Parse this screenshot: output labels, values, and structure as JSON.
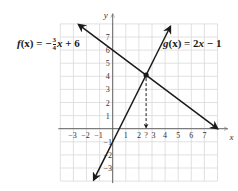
{
  "chart_data": {
    "type": "line",
    "title": "",
    "xlabel": "x",
    "ylabel": "y",
    "xlim": [
      -4,
      8
    ],
    "ylim": [
      -4,
      8
    ],
    "grid": true,
    "x_ticks": [
      -3,
      -2,
      -1,
      1,
      2,
      3,
      4,
      5,
      6,
      7
    ],
    "y_ticks": [
      -3,
      -2,
      -1,
      1,
      2,
      3,
      4,
      5,
      6,
      7
    ],
    "x_tick_labels": [
      "-3",
      "-2",
      "-1",
      "1",
      "2",
      "?",
      "3",
      "4",
      "5",
      "6",
      "7"
    ],
    "series": [
      {
        "name": "f(x) = -3/4 x + 6",
        "slope": -0.75,
        "intercept": 6,
        "x": [
          -2.6,
          8
        ],
        "y": [
          7.95,
          0
        ]
      },
      {
        "name": "g(x) = 2x - 1",
        "slope": 2,
        "intercept": -1,
        "x": [
          -1.45,
          4.4
        ],
        "y": [
          -3.9,
          7.8
        ]
      }
    ],
    "annotations": [
      {
        "type": "point",
        "x": 2.55,
        "y": 4.09,
        "label": "intersection"
      },
      {
        "type": "dashed-arrow",
        "from": [
          2.55,
          4.09
        ],
        "to": [
          2.55,
          0
        ],
        "label": "?"
      }
    ],
    "legend": "inline labels"
  },
  "labels": {
    "f_prefix": "f",
    "f_arg": "(x) = −",
    "f_num": "3",
    "f_den": "4",
    "f_suffix_var": "x",
    "f_suffix": " + 6",
    "g_prefix": "g",
    "g_arg": "(x) = 2",
    "g_var": "x",
    "g_suffix": " − 1",
    "x_axis": "x",
    "y_axis": "y",
    "question_mark": "?"
  },
  "colors": {
    "line": "#1a1a1a",
    "grid": "#d9d9d9",
    "axis": "#555555",
    "background": "#ffffff"
  }
}
